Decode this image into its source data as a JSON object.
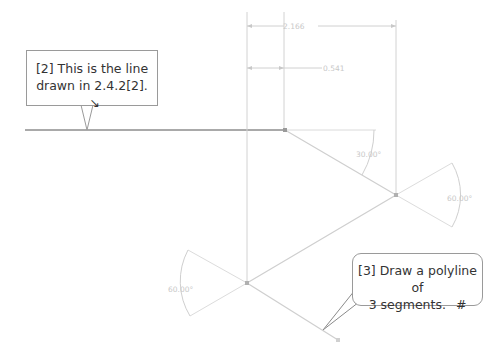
{
  "callouts": {
    "line_note": {
      "line1": "[2] This is the line",
      "line2": "drawn in 2.4.2[2].",
      "arrow_glyph": "↘"
    },
    "polyline_note": {
      "line1": "[3] Draw a polyline of",
      "line2": "3 segments.",
      "marker": "#"
    }
  },
  "dimensions": {
    "top_linear": "2.166",
    "second_linear": "0.541",
    "angle_1": "30.00°",
    "angle_2": "60.00°",
    "angle_3": "60.00°"
  },
  "colors": {
    "main_line": "#555555",
    "construction_line": "#cfcfcf",
    "dimension": "#c8c8c8",
    "callout_border": "#9a9a9a",
    "text": "#333333"
  },
  "geometry": {
    "base_line": {
      "from": [
        25,
        130
      ],
      "to": [
        285,
        130
      ]
    },
    "polyline": [
      [
        285,
        130
      ],
      [
        396,
        195
      ],
      [
        247,
        283
      ],
      [
        338,
        340
      ]
    ]
  }
}
